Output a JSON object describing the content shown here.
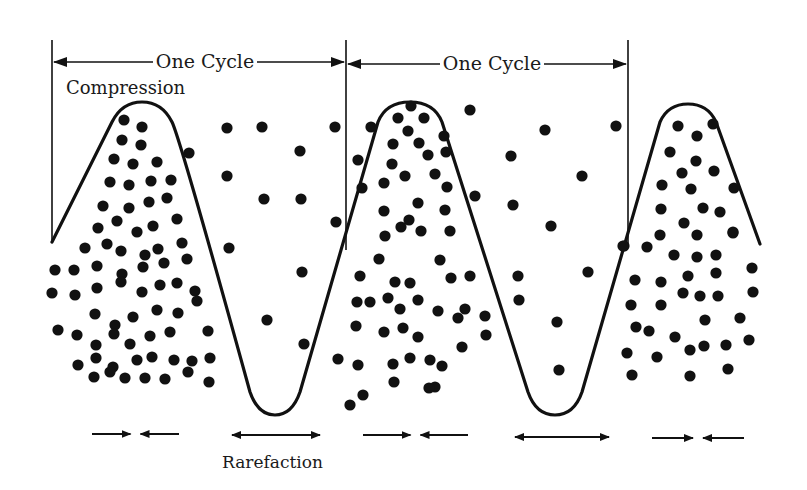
{
  "colors": {
    "ink": "#111111",
    "background": "#ffffff",
    "label": "#1a1a1a"
  },
  "labels": {
    "cycle_1": "One Cycle",
    "cycle_2": "One Cycle",
    "compression": "Compression",
    "rarefaction": "Rarefaction"
  },
  "cycle_markers": [
    {
      "x": 52,
      "y_top": 40,
      "y_bottom": 240
    },
    {
      "x": 346,
      "y_top": 40,
      "y_bottom": 250
    },
    {
      "x": 628,
      "y_top": 40,
      "y_bottom": 245
    }
  ],
  "cycle_arrows": [
    {
      "x1": 52,
      "x2": 346,
      "y": 62,
      "label_x": 205
    },
    {
      "x1": 346,
      "x2": 628,
      "y": 64,
      "label_x": 492
    }
  ],
  "wave_path": "M52,242 L112,122 Q122,102 142,102 Q162,102 172,122 Q180,138 250,392 Q258,415 275,415 Q292,415 300,392 L378,122 Q386,102 410,102 Q434,102 442,122 L528,392 Q536,415 555,415 Q574,415 582,392 L660,122 Q668,104 688,104 Q708,104 716,122 L760,244",
  "particles": [
    [
      124,
      120
    ],
    [
      142,
      127
    ],
    [
      122,
      140
    ],
    [
      141,
      145
    ],
    [
      114,
      159
    ],
    [
      133,
      164
    ],
    [
      157,
      162
    ],
    [
      110,
      182
    ],
    [
      129,
      185
    ],
    [
      151,
      181
    ],
    [
      171,
      180
    ],
    [
      189,
      153
    ],
    [
      103,
      206
    ],
    [
      129,
      208
    ],
    [
      149,
      202
    ],
    [
      167,
      198
    ],
    [
      98,
      228
    ],
    [
      117,
      221
    ],
    [
      137,
      232
    ],
    [
      153,
      226
    ],
    [
      177,
      219
    ],
    [
      85,
      248
    ],
    [
      107,
      244
    ],
    [
      121,
      251
    ],
    [
      145,
      255
    ],
    [
      158,
      249
    ],
    [
      182,
      243
    ],
    [
      55,
      270
    ],
    [
      74,
      270
    ],
    [
      97,
      266
    ],
    [
      122,
      274
    ],
    [
      143,
      267
    ],
    [
      164,
      263
    ],
    [
      187,
      259
    ],
    [
      52,
      293
    ],
    [
      75,
      295
    ],
    [
      97,
      288
    ],
    [
      121,
      282
    ],
    [
      142,
      292
    ],
    [
      160,
      285
    ],
    [
      177,
      283
    ],
    [
      195,
      291
    ],
    [
      95,
      314
    ],
    [
      115,
      325
    ],
    [
      133,
      317
    ],
    [
      157,
      310
    ],
    [
      178,
      313
    ],
    [
      197,
      301
    ],
    [
      58,
      330
    ],
    [
      77,
      335
    ],
    [
      96,
      345
    ],
    [
      114,
      334
    ],
    [
      130,
      344
    ],
    [
      150,
      336
    ],
    [
      170,
      332
    ],
    [
      208,
      331
    ],
    [
      78,
      365
    ],
    [
      96,
      358
    ],
    [
      113,
      367
    ],
    [
      137,
      360
    ],
    [
      152,
      357
    ],
    [
      174,
      360
    ],
    [
      192,
      361
    ],
    [
      210,
      358
    ],
    [
      94,
      377
    ],
    [
      110,
      372
    ],
    [
      125,
      378
    ],
    [
      145,
      378
    ],
    [
      165,
      379
    ],
    [
      188,
      372
    ],
    [
      209,
      382
    ],
    [
      227,
      128
    ],
    [
      262,
      127
    ],
    [
      300,
      151
    ],
    [
      227,
      176
    ],
    [
      264,
      199
    ],
    [
      301,
      199
    ],
    [
      229,
      248
    ],
    [
      302,
      272
    ],
    [
      267,
      320
    ],
    [
      304,
      344
    ],
    [
      335,
      127
    ],
    [
      336,
      222
    ],
    [
      411,
      106
    ],
    [
      398,
      118
    ],
    [
      424,
      118
    ],
    [
      408,
      131
    ],
    [
      393,
      144
    ],
    [
      419,
      143
    ],
    [
      444,
      136
    ],
    [
      371,
      127
    ],
    [
      358,
      160
    ],
    [
      392,
      164
    ],
    [
      428,
      155
    ],
    [
      446,
      152
    ],
    [
      384,
      183
    ],
    [
      405,
      176
    ],
    [
      435,
      174
    ],
    [
      362,
      188
    ],
    [
      384,
      211
    ],
    [
      418,
      203
    ],
    [
      409,
      220
    ],
    [
      447,
      187
    ],
    [
      445,
      210
    ],
    [
      385,
      236
    ],
    [
      379,
      259
    ],
    [
      401,
      227
    ],
    [
      421,
      231
    ],
    [
      450,
      231
    ],
    [
      440,
      260
    ],
    [
      360,
      276
    ],
    [
      395,
      282
    ],
    [
      410,
      283
    ],
    [
      451,
      278
    ],
    [
      357,
      302
    ],
    [
      370,
      302
    ],
    [
      388,
      298
    ],
    [
      400,
      309
    ],
    [
      418,
      300
    ],
    [
      438,
      311
    ],
    [
      458,
      318
    ],
    [
      470,
      276
    ],
    [
      475,
      196
    ],
    [
      356,
      326
    ],
    [
      384,
      332
    ],
    [
      403,
      328
    ],
    [
      418,
      337
    ],
    [
      465,
      309
    ],
    [
      485,
      316
    ],
    [
      486,
      335
    ],
    [
      462,
      347
    ],
    [
      338,
      359
    ],
    [
      358,
      365
    ],
    [
      393,
      364
    ],
    [
      410,
      358
    ],
    [
      430,
      360
    ],
    [
      442,
      366
    ],
    [
      435,
      387
    ],
    [
      350,
      405
    ],
    [
      363,
      395
    ],
    [
      394,
      382
    ],
    [
      429,
      388
    ],
    [
      470,
      110
    ],
    [
      545,
      130
    ],
    [
      511,
      156
    ],
    [
      582,
      176
    ],
    [
      513,
      205
    ],
    [
      551,
      226
    ],
    [
      518,
      276
    ],
    [
      519,
      300
    ],
    [
      557,
      322
    ],
    [
      559,
      370
    ],
    [
      588,
      272
    ],
    [
      616,
      126
    ],
    [
      624,
      246
    ],
    [
      678,
      126
    ],
    [
      697,
      136
    ],
    [
      713,
      124
    ],
    [
      670,
      152
    ],
    [
      696,
      161
    ],
    [
      682,
      173
    ],
    [
      714,
      171
    ],
    [
      662,
      185
    ],
    [
      691,
      189
    ],
    [
      734,
      188
    ],
    [
      661,
      209
    ],
    [
      703,
      208
    ],
    [
      720,
      212
    ],
    [
      684,
      223
    ],
    [
      697,
      235
    ],
    [
      660,
      235
    ],
    [
      733,
      232
    ],
    [
      623,
      246
    ],
    [
      647,
      247
    ],
    [
      674,
      255
    ],
    [
      697,
      257
    ],
    [
      716,
      255
    ],
    [
      733,
      233
    ],
    [
      635,
      280
    ],
    [
      661,
      282
    ],
    [
      688,
      276
    ],
    [
      716,
      273
    ],
    [
      752,
      268
    ],
    [
      631,
      305
    ],
    [
      661,
      305
    ],
    [
      683,
      293
    ],
    [
      700,
      296
    ],
    [
      718,
      296
    ],
    [
      753,
      292
    ],
    [
      636,
      327
    ],
    [
      649,
      331
    ],
    [
      675,
      337
    ],
    [
      705,
      320
    ],
    [
      740,
      318
    ],
    [
      627,
      353
    ],
    [
      657,
      357
    ],
    [
      690,
      350
    ],
    [
      704,
      346
    ],
    [
      726,
      345
    ],
    [
      749,
      340
    ],
    [
      632,
      375
    ],
    [
      690,
      376
    ],
    [
      728,
      369
    ]
  ],
  "motion_arrows": [
    {
      "type": "converge",
      "x1": 92,
      "x2": 179,
      "y": 434
    },
    {
      "type": "diverge",
      "x1": 232,
      "x2": 320,
      "y": 435
    },
    {
      "type": "converge",
      "x1": 363,
      "x2": 468,
      "y": 435
    },
    {
      "type": "diverge",
      "x1": 515,
      "x2": 609,
      "y": 437
    },
    {
      "type": "converge",
      "x1": 652,
      "x2": 744,
      "y": 438
    }
  ]
}
